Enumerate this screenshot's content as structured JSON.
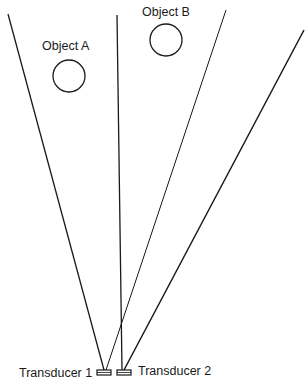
{
  "diagram": {
    "labels": {
      "object_a": "Object A",
      "object_b": "Object B",
      "transducer_1": "Transducer 1",
      "transducer_2": "Transducer 2"
    },
    "colors": {
      "line": "#1a1a1a",
      "background": "#ffffff"
    }
  }
}
